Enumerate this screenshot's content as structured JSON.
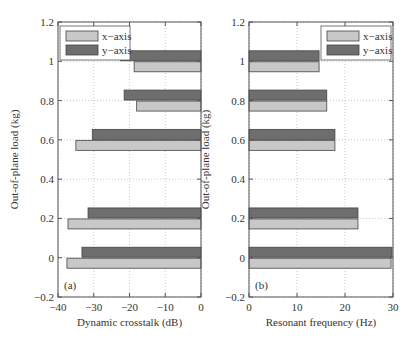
{
  "chart_data": [
    {
      "type": "bar",
      "orientation": "horizontal",
      "panel_label": "(a)",
      "xlabel": "Dynamic crosstalk (dB)",
      "ylabel": "Out-of-plane load (kg)",
      "xlim": [
        -40,
        0
      ],
      "ylim": [
        -0.2,
        1.2
      ],
      "xticks": [
        "−40",
        "−30",
        "−20",
        "−10",
        "0"
      ],
      "yticks": [
        "−0.2",
        "0",
        "0.2",
        "0.4",
        "0.6",
        "0.8",
        "1",
        "1.2"
      ],
      "grid": "dotted",
      "legend_position": "upper left",
      "categories": [
        0,
        0.2,
        0.6,
        0.8,
        1.0
      ],
      "series": [
        {
          "name": "x−axis",
          "color": "#c8c8c8",
          "values": [
            -37.5,
            -37.2,
            -35.0,
            -18.0,
            -18.7
          ]
        },
        {
          "name": "y−axis",
          "color": "#6e6e6e",
          "values": [
            -33.3,
            -31.6,
            -30.4,
            -21.5,
            -22.5
          ]
        }
      ]
    },
    {
      "type": "bar",
      "orientation": "horizontal",
      "panel_label": "(b)",
      "xlabel": "Resonant frequency (Hz)",
      "ylabel": "Out-of-plane load (kg)",
      "xlim": [
        0,
        30
      ],
      "ylim": [
        -0.2,
        1.2
      ],
      "xticks": [
        "0",
        "10",
        "20",
        "30"
      ],
      "yticks": [
        "−0.2",
        "0",
        "0.2",
        "0.4",
        "0.6",
        "0.8",
        "1",
        "1.2"
      ],
      "grid": "dotted",
      "legend_position": "upper right",
      "categories": [
        0,
        0.2,
        0.6,
        0.8,
        1.0
      ],
      "series": [
        {
          "name": "x−axis",
          "color": "#c8c8c8",
          "values": [
            29.6,
            22.7,
            17.9,
            16.2,
            14.6
          ]
        },
        {
          "name": "y−axis",
          "color": "#6e6e6e",
          "values": [
            29.8,
            22.7,
            17.9,
            16.2,
            14.6
          ]
        }
      ]
    }
  ]
}
